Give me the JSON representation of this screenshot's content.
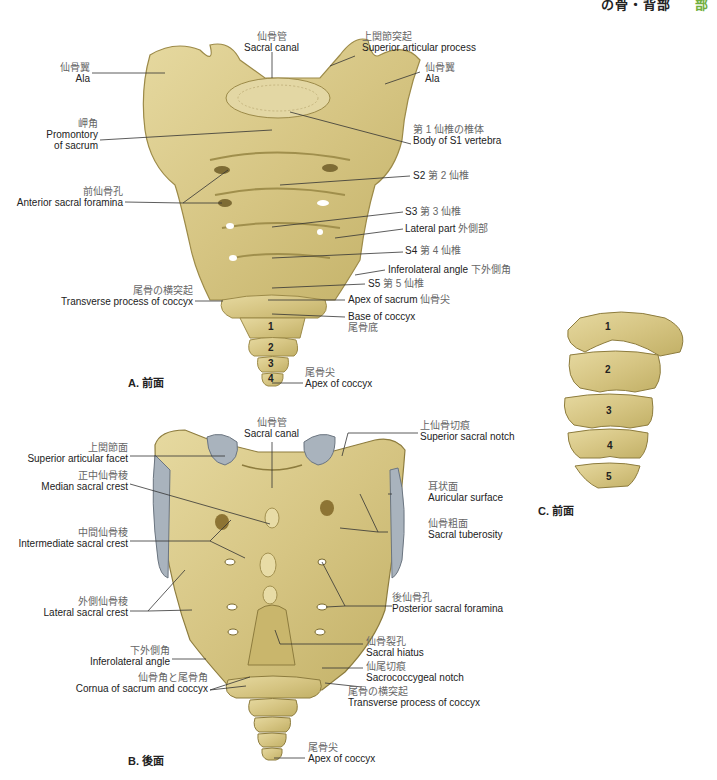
{
  "header": {
    "title_fragment": "の骨・背部",
    "page_fragment": "部"
  },
  "figures": {
    "A": {
      "caption": "A. 前面",
      "labels": {
        "sacral_canal": {
          "jp": "仙骨管",
          "en": "Sacral canal"
        },
        "superior_articular_process": {
          "jp": "上関節突起",
          "en": "Superior articular process"
        },
        "ala_left": {
          "jp": "仙骨翼",
          "en": "Ala"
        },
        "ala_right": {
          "jp": "仙骨翼",
          "en": "Ala"
        },
        "promontory": {
          "jp": "岬角",
          "en": "Promontory",
          "en2": "of sacrum"
        },
        "body_s1": {
          "jp": "第 1 仙椎の椎体",
          "en": "Body of S1 vertebra"
        },
        "s2": {
          "en": "S2",
          "jp": "第 2 仙椎"
        },
        "anterior_foramina": {
          "jp": "前仙骨孔",
          "en": "Anterior sacral foramina"
        },
        "s3": {
          "en": "S3",
          "jp": "第 3 仙椎"
        },
        "lateral_part": {
          "en": "Lateral part",
          "jp": "外側部"
        },
        "s4": {
          "en": "S4",
          "jp": "第 4 仙椎"
        },
        "inferolateral_angle": {
          "en": "Inferolateral angle",
          "jp": "下外側角"
        },
        "s5": {
          "en": "S5",
          "jp": "第 5 仙椎"
        },
        "transverse_process_coccyx": {
          "jp": "尾骨の横突起",
          "en": "Transverse process of coccyx"
        },
        "apex_sacrum": {
          "en": "Apex of sacrum",
          "jp": "仙骨尖"
        },
        "base_coccyx": {
          "en": "Base of coccyx",
          "jp": "尾骨底"
        },
        "apex_coccyx": {
          "jp": "尾骨尖",
          "en": "Apex of coccyx"
        }
      },
      "coccyx_numbers": [
        "1",
        "2",
        "3",
        "4"
      ]
    },
    "B": {
      "caption": "B. 後面",
      "labels": {
        "sacral_canal": {
          "jp": "仙骨管",
          "en": "Sacral canal"
        },
        "superior_sacral_notch": {
          "jp": "上仙骨切痕",
          "en": "Superior sacral notch"
        },
        "superior_articular_facet": {
          "jp": "上関節面",
          "en": "Superior articular facet"
        },
        "median_sacral_crest": {
          "jp": "正中仙骨稜",
          "en": "Median sacral crest"
        },
        "auricular_surface": {
          "jp": "耳状面",
          "en": "Auricular surface"
        },
        "intermediate_sacral_crest": {
          "jp": "中間仙骨稜",
          "en": "Intermediate sacral crest"
        },
        "sacral_tuberosity": {
          "jp": "仙骨粗面",
          "en": "Sacral tuberosity"
        },
        "lateral_sacral_crest": {
          "jp": "外側仙骨稜",
          "en": "Lateral sacral crest"
        },
        "posterior_sacral_foramina": {
          "jp": "後仙骨孔",
          "en": "Posterior sacral foramina"
        },
        "inferolateral_angle": {
          "jp": "下外側角",
          "en": "Inferolateral angle"
        },
        "sacral_hiatus": {
          "jp": "仙骨裂孔",
          "en": "Sacral hiatus"
        },
        "sacrococcygeal_notch": {
          "jp": "仙尾切痕",
          "en": "Sacrococcygeal notch"
        },
        "cornua": {
          "jp": "仙骨角と尾骨角",
          "en": "Cornua of sacrum and coccyx"
        },
        "transverse_process_coccyx": {
          "jp": "尾骨の横突起",
          "en": "Transverse process of coccyx"
        },
        "apex_coccyx": {
          "jp": "尾骨尖",
          "en": "Apex of coccyx"
        }
      }
    },
    "C": {
      "caption": "C. 前面",
      "vertebra_numbers": [
        "1",
        "2",
        "3",
        "4",
        "5"
      ]
    }
  },
  "colors": {
    "bone": "#d9cb8c",
    "bone_dark": "#b8a660",
    "bone_edge": "#8d7c3e",
    "facet": "#a9b3bd",
    "accent_green": "#6fae3c"
  }
}
